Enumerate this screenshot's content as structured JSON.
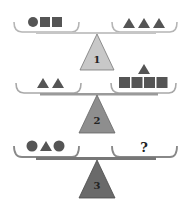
{
  "colors": {
    "shape": "#555555",
    "pan": "#9a9a9a",
    "beam": "#8a8a8a",
    "fulcrum_1": "#c8c8c8",
    "fulcrum_2": "#8e8e8e",
    "fulcrum_3": "#6a6a6a"
  },
  "scales": [
    {
      "label": "1",
      "left_pan": [
        "circle",
        "square",
        "square"
      ],
      "right_pan": [
        "triangle",
        "triangle",
        "triangle"
      ]
    },
    {
      "label": "2",
      "left_pan": [
        "triangle",
        "triangle"
      ],
      "right_pan": [
        "square",
        "square",
        "square",
        "square",
        "triangle"
      ]
    },
    {
      "label": "3",
      "left_pan": [
        "circle",
        "triangle",
        "circle"
      ],
      "right_pan": [
        "?"
      ]
    }
  ]
}
